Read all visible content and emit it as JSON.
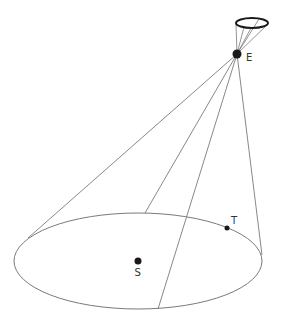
{
  "diagram": {
    "type": "cone-projection",
    "colors": {
      "line": "#7a7a7a",
      "dot": "#1a1a1a",
      "label": "#333333",
      "background": "#ffffff"
    },
    "points": {
      "E": {
        "label": "E",
        "x": 237,
        "y": 54
      },
      "S": {
        "label": "S",
        "x": 138,
        "y": 261
      },
      "T": {
        "label": "T",
        "x": 227,
        "y": 228
      }
    },
    "base_ellipse": {
      "cx": 138,
      "cy": 261,
      "rx": 124,
      "ry": 48
    },
    "lens_ellipse": {
      "cx": 252,
      "cy": 23,
      "rx": 17,
      "ry": 5
    }
  }
}
